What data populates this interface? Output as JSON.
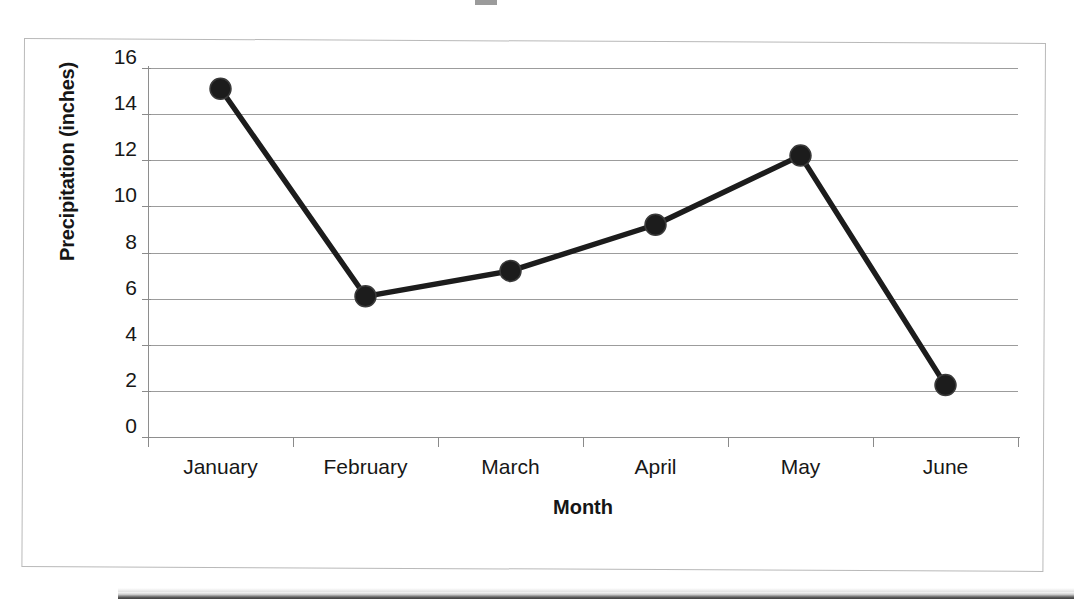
{
  "chart_data": {
    "type": "line",
    "title": "",
    "categories": [
      "January",
      "February",
      "March",
      "April",
      "May",
      "June"
    ],
    "values": [
      15.1,
      6.1,
      7.2,
      9.2,
      12.2,
      2.25
    ],
    "series": [
      {
        "name": "Precipitation",
        "values": [
          15.1,
          6.1,
          7.2,
          9.2,
          12.2,
          2.25
        ]
      }
    ],
    "xlabel": "Month",
    "ylabel": "Precipitation (inches)",
    "ylim": [
      0,
      16
    ],
    "ytick_labels": [
      "16",
      "14",
      "12",
      "10",
      "8",
      "6",
      "4",
      "2",
      "0"
    ],
    "ytick_values": [
      16,
      14,
      12,
      10,
      8,
      6,
      4,
      2,
      0
    ],
    "grid": "horizontal",
    "legend": "none",
    "marker": "circle",
    "line_color": "#1c1c1c",
    "marker_color": "#1c1c1c",
    "grid_color": "#9c9c9c",
    "axis_color": "#8e8e8e"
  },
  "axes": {
    "y_title": "Precipitation (inches)",
    "x_title": "Month"
  },
  "y_ticks": [
    {
      "label": "16"
    },
    {
      "label": "14"
    },
    {
      "label": "12"
    },
    {
      "label": "10"
    },
    {
      "label": "8"
    },
    {
      "label": "6"
    },
    {
      "label": "4"
    },
    {
      "label": "2"
    },
    {
      "label": "0"
    }
  ],
  "x_ticks": [
    {
      "label": "January"
    },
    {
      "label": "February"
    },
    {
      "label": "March"
    },
    {
      "label": "April"
    },
    {
      "label": "May"
    },
    {
      "label": "June"
    }
  ]
}
